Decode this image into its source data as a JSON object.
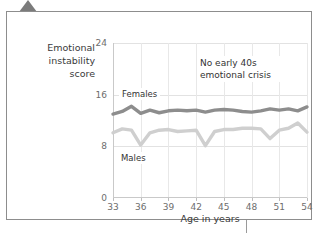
{
  "card": {
    "pointer_icon": "triangle-pointer-icon",
    "connector_icon": "callout-connector-line"
  },
  "chart_data": {
    "type": "line",
    "title": "",
    "xlabel": "Age in years",
    "ylabel": "Emotional instability score",
    "xlim": [
      33,
      54
    ],
    "ylim": [
      0,
      24
    ],
    "grid": true,
    "legend": "inline-labels",
    "annotations": [
      {
        "text": "No early 40s emotional crisis",
        "x": 46.5,
        "y": 21
      }
    ],
    "yticks": [
      0,
      8,
      16,
      24
    ],
    "xticks": [
      33,
      36,
      39,
      42,
      45,
      48,
      51,
      54
    ],
    "x": [
      33,
      34,
      35,
      36,
      37,
      38,
      39,
      40,
      41,
      42,
      43,
      44,
      45,
      46,
      47,
      48,
      49,
      50,
      51,
      52,
      53,
      54
    ],
    "series": [
      {
        "name": "Females",
        "color": "#8d8d8d",
        "values": [
          13.0,
          13.4,
          14.2,
          13.1,
          13.6,
          13.2,
          13.5,
          13.6,
          13.5,
          13.6,
          13.3,
          13.6,
          13.7,
          13.6,
          13.4,
          13.3,
          13.5,
          13.8,
          13.6,
          13.8,
          13.5,
          14.1
        ]
      },
      {
        "name": "Males",
        "color": "#cfcfcf",
        "values": [
          10.1,
          10.7,
          10.5,
          8.2,
          10.1,
          10.5,
          10.6,
          10.3,
          10.4,
          10.5,
          8.1,
          10.3,
          10.6,
          10.6,
          10.8,
          10.8,
          10.7,
          9.2,
          10.5,
          10.8,
          11.6,
          10.2
        ]
      }
    ]
  },
  "y_tick_labels": [
    "24",
    "16",
    "8",
    "0"
  ],
  "x_tick_labels": [
    "33",
    "36",
    "39",
    "42",
    "45",
    "48",
    "51",
    "54"
  ],
  "labels": {
    "y_axis_title": "Emotional instability score",
    "x_axis_title": "Age in years",
    "annotation": "No early 40s emotional crisis",
    "annotation_line1": "No early 40s",
    "annotation_line2": "emotional crisis",
    "females": "Females",
    "males": "Males"
  }
}
